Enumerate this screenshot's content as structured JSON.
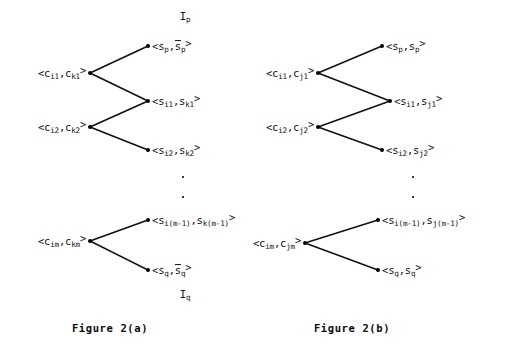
{
  "figure": {
    "background_color": "#ffffff",
    "ink_color": "#111111",
    "panels": [
      {
        "id": "panel-a",
        "caption": "Figure 2(a)",
        "caption_x": 110,
        "caption_y": 328,
        "dots_x": 183,
        "dots_y": 187,
        "top_annotation": {
          "text_main": "I",
          "text_sub": "p",
          "x": 185,
          "y": 17
        },
        "bottom_annotation": {
          "text_main": "I",
          "text_sub": "q",
          "x": 185,
          "y": 295
        },
        "left_nodes": [
          {
            "id": "a-c1",
            "x": 90,
            "y": 73,
            "label_parts": [
              "<c",
              "i1",
              ",c",
              "k1",
              ">"
            ]
          },
          {
            "id": "a-c2",
            "x": 90,
            "y": 127,
            "label_parts": [
              "<c",
              "i2",
              ",c",
              "k2",
              ">"
            ]
          },
          {
            "id": "a-cm",
            "x": 90,
            "y": 241,
            "label_parts": [
              "<c",
              "im",
              ",c",
              "km",
              ">"
            ]
          }
        ],
        "right_nodes": [
          {
            "id": "a-s-p",
            "x": 148,
            "y": 46,
            "label_parts": [
              "<s",
              "p",
              ",",
              "s_bar",
              "p",
              ">"
            ],
            "overbar": true
          },
          {
            "id": "a-s-1",
            "x": 148,
            "y": 101,
            "label_parts": [
              "<s",
              "i1",
              ",s",
              "k1",
              ">"
            ],
            "overbar": false
          },
          {
            "id": "a-s-2",
            "x": 148,
            "y": 150,
            "label_parts": [
              "<s",
              "i2",
              ",s",
              "k2",
              ">"
            ],
            "overbar": false
          },
          {
            "id": "a-s-m1",
            "x": 148,
            "y": 220,
            "label_parts": [
              "<s",
              "i(m-1)",
              ",s",
              "k(m-1)",
              ">"
            ],
            "overbar": false
          },
          {
            "id": "a-s-q",
            "x": 148,
            "y": 270,
            "label_parts": [
              "<s",
              "q",
              ",",
              "s_bar",
              "q",
              ">"
            ],
            "overbar": true
          }
        ],
        "edges": [
          {
            "from": "a-c1",
            "to": "a-s-p"
          },
          {
            "from": "a-c1",
            "to": "a-s-1"
          },
          {
            "from": "a-c2",
            "to": "a-s-1"
          },
          {
            "from": "a-c2",
            "to": "a-s-2"
          },
          {
            "from": "a-cm",
            "to": "a-s-m1"
          },
          {
            "from": "a-cm",
            "to": "a-s-q"
          }
        ]
      },
      {
        "id": "panel-b",
        "caption": "Figure 2(b)",
        "caption_x": 352,
        "caption_y": 328,
        "dots_x": 413,
        "dots_y": 187,
        "left_nodes": [
          {
            "id": "b-c1",
            "x": 318,
            "y": 73,
            "label_parts": [
              "<c",
              "i1",
              ",c",
              "j1",
              ">"
            ]
          },
          {
            "id": "b-c2",
            "x": 318,
            "y": 127,
            "label_parts": [
              "<c",
              "i2",
              ",c",
              "j2",
              ">"
            ]
          },
          {
            "id": "b-cm",
            "x": 305,
            "y": 243,
            "label_parts": [
              "<c",
              "im",
              ",c",
              "jm",
              ">"
            ]
          }
        ],
        "right_nodes": [
          {
            "id": "b-s-p",
            "x": 382,
            "y": 46,
            "label_parts": [
              "<s",
              "p",
              ",s",
              "p",
              ">"
            ]
          },
          {
            "id": "b-s-1",
            "x": 390,
            "y": 101,
            "label_parts": [
              "<s",
              "i1",
              ",s",
              "j1",
              ">"
            ]
          },
          {
            "id": "b-s-2",
            "x": 382,
            "y": 150,
            "label_parts": [
              "<s",
              "i2",
              ",s",
              "j2",
              ">"
            ]
          },
          {
            "id": "b-s-m1",
            "x": 378,
            "y": 220,
            "label_parts": [
              "<s",
              "i(m-1)",
              ",s",
              "j(m-1)",
              ">"
            ]
          },
          {
            "id": "b-s-q",
            "x": 378,
            "y": 270,
            "label_parts": [
              "<s",
              "q",
              ",s",
              "q",
              ">"
            ]
          }
        ],
        "edges": [
          {
            "from": "b-c1",
            "to": "b-s-p"
          },
          {
            "from": "b-c1",
            "to": "b-s-1"
          },
          {
            "from": "b-c2",
            "to": "b-s-1"
          },
          {
            "from": "b-c2",
            "to": "b-s-2"
          },
          {
            "from": "b-cm",
            "to": "b-s-m1"
          },
          {
            "from": "b-cm",
            "to": "b-s-q"
          }
        ]
      }
    ],
    "labels": {
      "a_c_i1_k1": "<cᵢ₁,cₖ₁>",
      "a_c_i2_k2": "<cᵢ₂,cₖ₂>",
      "a_c_im_km": "<cᵢₘ,cₖₘ>",
      "a_s_p": "<sₚ,s̄ₚ>",
      "a_s_i1_k1": "<sᵢ₁,sₖ₁>",
      "a_s_i2_k2": "<sᵢ₂,sₖ₂>",
      "a_s_im1_km1": "<sᵢ(m-1),sₖ(m-1)>",
      "a_s_q": "<s_q,s̄_q>",
      "a_I_p": "Iₚ",
      "a_I_q": "I_q",
      "b_c_i1_j1": "<cᵢ₁,cⱼ₁>",
      "b_c_i2_j2": "<cᵢ₂,cⱼ₂>",
      "b_c_im_jm": "<cᵢₘ,cⱼₘ>",
      "b_s_p": "<sₚ,sₚ>",
      "b_s_i1_j1": "<sᵢ₁,sⱼ₁>",
      "b_s_i2_j2": "<sᵢ₂,sⱼ₂>",
      "b_s_im1_jm1": "<sᵢ(m-1),sⱼ(m-1)>",
      "b_s_q": "<s_q,s_q>"
    }
  }
}
